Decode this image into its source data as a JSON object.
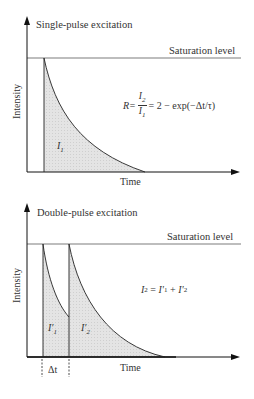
{
  "panels": [
    {
      "title": "Single-pulse excitation",
      "saturation_label": "Saturation level",
      "y_axis_label": "Intensity",
      "x_axis_label": "Time",
      "area_labels": [
        {
          "text": "I",
          "sub": "1"
        }
      ],
      "formula": {
        "lhs": "R=",
        "num_text": "I",
        "num_sub": "2",
        "den_text": "I",
        "den_sub": "1",
        "rhs": "= 2 − exp(−Δt/τ)"
      }
    },
    {
      "title": "Double-pulse excitation",
      "saturation_label": "Saturation level",
      "y_axis_label": "Intensity",
      "x_axis_label": "Time",
      "area_labels": [
        {
          "text": "I′",
          "sub": "1"
        },
        {
          "text": "I′",
          "sub": "2"
        }
      ],
      "formula": {
        "lhs_text": "I",
        "lhs_sub": "2",
        "mid": " = ",
        "t1": "I′",
        "t1_sub": "1",
        "plus": " + ",
        "t2": "I′",
        "t2_sub": "2"
      },
      "delay_label": "Δt"
    }
  ],
  "colors": {
    "axis": "#111111",
    "fill": "#dcdcdc",
    "line": "#222222"
  }
}
